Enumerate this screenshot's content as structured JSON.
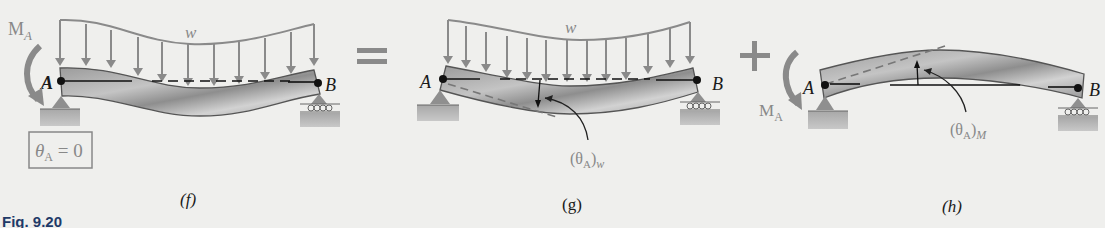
{
  "figure": {
    "caption_fragment": "Fig. 9.20",
    "operators": {
      "equals": "=",
      "plus": "+"
    },
    "panels": [
      {
        "id": "f",
        "label": "(f)",
        "load_label": "w",
        "moment_label": "M",
        "moment_subscript": "A",
        "support_left_label": "A",
        "support_right_label": "B",
        "condition_box": {
          "symbol": "θ",
          "subscript": "A",
          "rest": " = 0"
        }
      },
      {
        "id": "g",
        "label": "(g)",
        "load_label": "w",
        "support_left_label": "A",
        "support_right_label": "B",
        "slope_label": {
          "open": "(θ",
          "subscript": "A",
          "close": ")",
          "suffix": "w"
        }
      },
      {
        "id": "h",
        "label": "(h)",
        "moment_label": "M",
        "moment_subscript": "A",
        "support_left_label": "A",
        "support_right_label": "B",
        "slope_label": {
          "open": "(θ",
          "subscript": "A",
          "close": ")",
          "suffix": "M"
        }
      }
    ],
    "colors": {
      "background": "#efefed",
      "load_arrows": "#8a8a8a",
      "beam_fill": "#a9a9a9",
      "beam_edge": "#555555",
      "support": "#8f8f8f",
      "ground": "#b5b5b5",
      "moment_arrow": "#8a8a8a",
      "reference_line": "#111111",
      "caption": "#1f3a68"
    }
  }
}
